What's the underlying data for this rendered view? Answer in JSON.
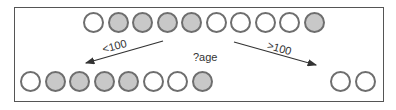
{
  "diagram": {
    "split_feature_label": "?age",
    "colors": {
      "filled": "#c8c8c8",
      "empty": "#ffffff",
      "stroke": "#6e6e6e",
      "frame": "#555555",
      "arrow": "#333333"
    },
    "root_node": {
      "circles": [
        "empty",
        "filled",
        "filled",
        "filled",
        "filled",
        "empty",
        "empty",
        "empty",
        "empty",
        "filled"
      ]
    },
    "left_branch": {
      "condition_label": "<100",
      "circles": [
        "empty",
        "filled",
        "filled",
        "filled",
        "filled",
        "empty",
        "empty",
        "filled"
      ]
    },
    "right_branch": {
      "condition_label": ">100",
      "circles": [
        "empty",
        "empty"
      ]
    }
  }
}
